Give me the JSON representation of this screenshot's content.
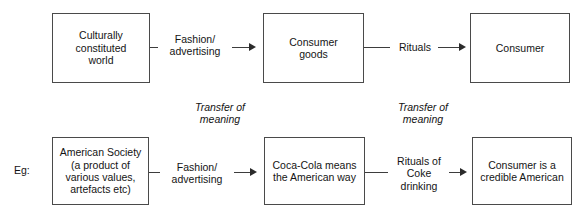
{
  "diagram": {
    "type": "flow-diagram",
    "background_color": "#ffffff",
    "box_border_color": "#4a4a4a",
    "line_color": "#3d3d3d",
    "text_color": "#141414",
    "rows": [
      {
        "id": "general-model",
        "prefix": "",
        "nodes": [
          {
            "id": "culturally-constituted-world",
            "label": "Culturally\nconstituted\nworld"
          },
          {
            "id": "consumer-goods",
            "label": "Consumer\ngoods"
          },
          {
            "id": "consumer",
            "label": "Consumer"
          }
        ],
        "edges": [
          {
            "id": "edge-fashion-advertising-top",
            "label": "Fashion/\nadvertising",
            "from": "culturally-constituted-world",
            "to": "consumer-goods"
          },
          {
            "id": "edge-rituals-top",
            "label": "Rituals",
            "from": "consumer-goods",
            "to": "consumer"
          }
        ]
      },
      {
        "id": "coca-cola-example",
        "prefix": "Eg:",
        "nodes": [
          {
            "id": "american-society",
            "label": "American Society\n(a product of\nvarious values,\nartefacts etc)"
          },
          {
            "id": "coca-cola-meaning",
            "label": "Coca-Cola  means\nthe American way"
          },
          {
            "id": "credible-american",
            "label": "Consumer is a\ncredible  American"
          }
        ],
        "edges": [
          {
            "id": "edge-fashion-advertising-bottom",
            "label": "Fashion/\nadvertising",
            "from": "american-society",
            "to": "coca-cola-meaning"
          },
          {
            "id": "edge-rituals-of-coke",
            "label": "Rituals of\nCoke\ndrinking",
            "from": "coca-cola-meaning",
            "to": "credible-american"
          }
        ]
      }
    ],
    "annotations": [
      {
        "id": "transfer-of-meaning-1",
        "text": "Transfer of\nmeaning",
        "style": "italic"
      },
      {
        "id": "transfer-of-meaning-2",
        "text": "Transfer of\nmeaning",
        "style": "italic"
      }
    ]
  }
}
